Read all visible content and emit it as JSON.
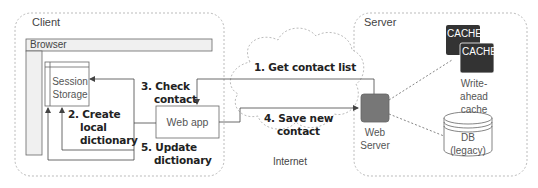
{
  "regions": {
    "client": "Client",
    "server": "Server",
    "internet": "Internet"
  },
  "components": {
    "browser": "Browser",
    "session_storage": [
      "Session",
      "Storage"
    ],
    "web_app": "Web app",
    "web_server": [
      "Web",
      "Server"
    ],
    "cache_front": "CACHE",
    "cache_back": "CACHE",
    "write_ahead_cache": [
      "Write-ahead",
      "cache"
    ],
    "db": [
      "DB",
      "(legacy)"
    ]
  },
  "steps": {
    "s1": "1. Get contact list",
    "s2": [
      "2. Create",
      "local",
      "dictionary"
    ],
    "s3": [
      "3. Check",
      "contact"
    ],
    "s4": [
      "4. Save new",
      "contact"
    ],
    "s5": [
      "5. Update",
      "dictionary"
    ]
  },
  "colors": {
    "line": "#555555",
    "dashed": "#999999",
    "browser_fill": "#f0f0f0",
    "web_server_fill": "#777777",
    "cache_fill": "#333333"
  }
}
